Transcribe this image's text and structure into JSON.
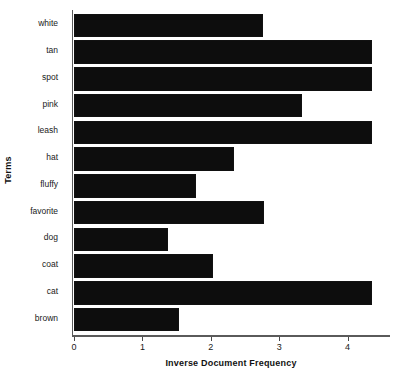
{
  "chart_data": {
    "type": "bar",
    "orientation": "horizontal",
    "title": "",
    "xlabel": "Inverse Document Frequency",
    "ylabel": "Terms",
    "categories": [
      "white",
      "tan",
      "spot",
      "pink",
      "leash",
      "hat",
      "fluffy",
      "favorite",
      "dog",
      "coat",
      "cat",
      "brown"
    ],
    "values": [
      2.77,
      4.35,
      4.35,
      3.34,
      4.35,
      2.34,
      1.78,
      2.78,
      1.37,
      2.03,
      4.35,
      1.53
    ],
    "xlim": [
      0,
      4.62
    ],
    "xticks": [
      0,
      1,
      2,
      3,
      4
    ],
    "xtick_labels": [
      "0",
      "1",
      "2",
      "3",
      "4"
    ],
    "grid": false,
    "legend": null,
    "bar_color": "#0d0d0d",
    "axis_color": "#5a5a5a"
  }
}
